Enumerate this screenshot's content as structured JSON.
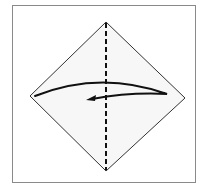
{
  "diagram": {
    "type": "origami-fold-step",
    "frame": {
      "border_color": "#8a8a8a",
      "background": "#ffffff"
    },
    "paper": {
      "shape": "diamond",
      "fill": "#f7f7f7",
      "stroke": "#333333",
      "vertices": {
        "top": [
          106,
          22
        ],
        "right": [
          185,
          98
        ],
        "bottom": [
          106,
          171
        ],
        "left": [
          30,
          96
        ]
      }
    },
    "fold_line": {
      "style": "valley-dashed",
      "orientation": "vertical",
      "color": "#111111",
      "from": [
        106,
        22
      ],
      "to": [
        106,
        171
      ]
    },
    "arrow": {
      "meaning": "fold right corner over to the left",
      "color": "#111111",
      "direction": "right-to-left"
    }
  }
}
